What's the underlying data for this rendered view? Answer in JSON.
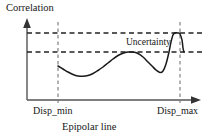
{
  "figure": {
    "ylabel": "Correlation",
    "xlabel": "Epipolar line",
    "annotation": "Uncertainty",
    "tick_labels": {
      "min": "Disp_min",
      "max": "Disp_max"
    },
    "colors": {
      "curve": "#1a1a1a",
      "axis": "#444444",
      "dashed": "#222222",
      "background": "#ffffff"
    }
  },
  "chart_data": {
    "type": "line",
    "title": "",
    "xlabel": "Epipolar line",
    "ylabel": "Correlation",
    "grid": false,
    "legend": null,
    "xlim": [
      27,
      200
    ],
    "ylim": [
      100,
      20
    ],
    "axis_ticks": {
      "x": [
        {
          "label": "Disp_min",
          "x": 58
        },
        {
          "label": "Disp_max",
          "x": 180
        }
      ],
      "y": []
    },
    "reference_lines": [
      {
        "orientation": "horizontal",
        "y": 33,
        "style": "dashed",
        "name": "upper-correlation-bound"
      },
      {
        "orientation": "horizontal",
        "y": 52,
        "style": "dashed",
        "name": "lower-correlation-bound"
      },
      {
        "orientation": "vertical",
        "x": 58,
        "style": "dashed",
        "name": "disp-min-line"
      },
      {
        "orientation": "vertical",
        "x": 180,
        "style": "dashed",
        "name": "disp-max-line"
      }
    ],
    "annotations": [
      {
        "text": "Uncertainty",
        "x": 126,
        "y": 44
      }
    ],
    "series": [
      {
        "name": "correlation-curve",
        "points": [
          [
            58,
            66
          ],
          [
            63,
            69
          ],
          [
            68,
            72
          ],
          [
            73,
            74.5
          ],
          [
            78,
            76
          ],
          [
            83,
            76.3
          ],
          [
            88,
            75.5
          ],
          [
            93,
            73.5
          ],
          [
            98,
            70.5
          ],
          [
            103,
            67
          ],
          [
            108,
            63
          ],
          [
            113,
            59
          ],
          [
            118,
            55.5
          ],
          [
            123,
            53.2
          ],
          [
            128,
            52.1
          ],
          [
            133,
            52.0
          ],
          [
            138,
            53.5
          ],
          [
            143,
            57
          ],
          [
            148,
            62
          ],
          [
            152,
            66
          ],
          [
            156,
            70
          ],
          [
            160,
            72.5
          ],
          [
            163,
            71
          ],
          [
            166,
            64
          ],
          [
            169,
            52
          ],
          [
            171,
            42
          ],
          [
            173,
            35
          ],
          [
            175,
            33
          ],
          [
            178,
            33
          ],
          [
            180,
            34
          ],
          [
            182,
            40
          ],
          [
            183,
            48
          ],
          [
            184,
            52
          ]
        ]
      }
    ]
  }
}
